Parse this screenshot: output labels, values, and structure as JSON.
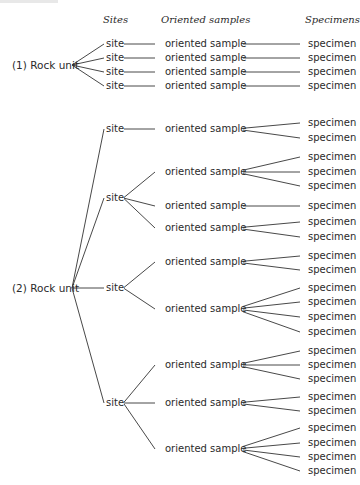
{
  "headers": {
    "sites": "Sites",
    "oriented_samples": "Oriented samples",
    "specimens": "Specimens"
  },
  "labels": {
    "rock_unit_1": "(1) Rock unit",
    "rock_unit_2": "(2) Rock unit",
    "site": "site",
    "oriented_sample": "oriented sample",
    "specimen": "specimen"
  },
  "tree": [
    {
      "label": "(1) Rock unit",
      "y": 65,
      "sites": [
        {
          "y": 44,
          "samples": [
            {
              "y": 44,
              "specimens": [
                44
              ]
            }
          ]
        },
        {
          "y": 58,
          "samples": [
            {
              "y": 58,
              "specimens": [
                58
              ]
            }
          ]
        },
        {
          "y": 72,
          "samples": [
            {
              "y": 72,
              "specimens": [
                72
              ]
            }
          ]
        },
        {
          "y": 86,
          "samples": [
            {
              "y": 86,
              "specimens": [
                86
              ]
            }
          ]
        }
      ]
    },
    {
      "label": "(2) Rock unit",
      "y": 288,
      "sites": [
        {
          "y": 129,
          "samples": [
            {
              "y": 129,
              "specimens": [
                123,
                138
              ]
            }
          ]
        },
        {
          "y": 198,
          "samples": [
            {
              "y": 172,
              "specimens": [
                157,
                172,
                186
              ]
            },
            {
              "y": 206,
              "specimens": [
                206
              ]
            },
            {
              "y": 228,
              "specimens": [
                222,
                237
              ]
            }
          ]
        },
        {
          "y": 288,
          "samples": [
            {
              "y": 262,
              "specimens": [
                256,
                270
              ]
            },
            {
              "y": 309,
              "specimens": [
                288,
                302,
                317,
                332
              ]
            }
          ]
        },
        {
          "y": 403,
          "samples": [
            {
              "y": 365,
              "specimens": [
                351,
                365,
                379
              ]
            },
            {
              "y": 403,
              "specimens": [
                397,
                411
              ]
            },
            {
              "y": 449,
              "specimens": [
                428,
                443,
                457,
                471
              ]
            }
          ]
        }
      ]
    }
  ]
}
